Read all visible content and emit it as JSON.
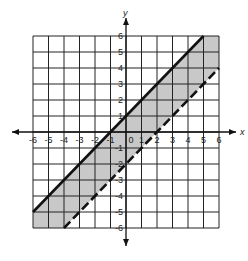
{
  "chart_data": {
    "type": "inequality-graph",
    "title": "",
    "xlabel": "x",
    "ylabel": "y",
    "xlim": [
      -6,
      6
    ],
    "ylim": [
      -6,
      6
    ],
    "grid": true,
    "x_ticks": [
      "-6",
      "-5",
      "-4",
      "-3",
      "-2",
      "-1",
      "0",
      "1",
      "2",
      "3",
      "4",
      "5",
      "6"
    ],
    "y_ticks": [
      "6",
      "5",
      "4",
      "3",
      "2",
      "1",
      "-1",
      "-2",
      "-3",
      "-4",
      "-5",
      "-6"
    ],
    "origin_label": "0",
    "boundary_lines": [
      {
        "name": "upper",
        "equation": "y = x + 1",
        "style": "solid",
        "from": [
          -6,
          -5
        ],
        "to": [
          5,
          6
        ]
      },
      {
        "name": "lower",
        "equation": "y = x - 2",
        "style": "dashed",
        "from": [
          -4,
          -6
        ],
        "to": [
          6,
          4
        ]
      }
    ],
    "shaded_region": "x - 2 < y <= x + 1",
    "shade_color": "#c8c8c8",
    "line_color": "#111111",
    "grid_color": "#222222"
  }
}
